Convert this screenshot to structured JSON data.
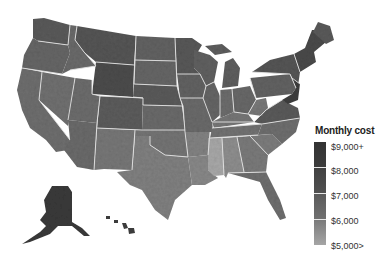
{
  "map": {
    "title": "Monthly cost by county, United States",
    "region": "United States (contiguous + Alaska + Hawaii)",
    "colors": {
      "background": "#ffffff",
      "state_border": "#e6e6e6",
      "very_high": "#3a3a3a",
      "high": "#525252",
      "mid_high": "#666666",
      "mid": "#7c7c7c",
      "low": "#9a9a9a",
      "very_low": "#b5b5b5"
    }
  },
  "legend": {
    "title": "Monthly cost",
    "labels": [
      "$9,000+",
      "$8,000",
      "$7,000",
      "$6,000",
      "$5,000>"
    ],
    "segment_colors": [
      "#353535",
      "#4a4a4a",
      "#636363",
      "#8a8a8a"
    ]
  }
}
